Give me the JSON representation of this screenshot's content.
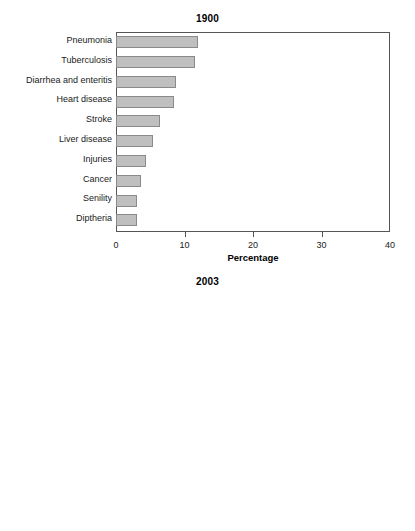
{
  "figure": {
    "panels": [
      "chart_1900",
      "chart_2003"
    ]
  },
  "chart_data": [
    {
      "type": "bar",
      "orientation": "horizontal",
      "title": "1900",
      "xlabel": "Percentage",
      "ylabel": "",
      "xlim": [
        0,
        40
      ],
      "xticks": [
        0,
        10,
        20,
        30,
        40
      ],
      "xtick_labels": [
        "0",
        "10",
        "20",
        "30",
        "40"
      ],
      "grid": false,
      "legend": false,
      "bar_color": "#bfbfbf",
      "bar_edge_color": "#8a8a8a",
      "categories": [
        "Pneumonia",
        "Tuberculosis",
        "Diarrhea and enteritis",
        "Heart disease",
        "Stroke",
        "Liver disease",
        "Injuries",
        "Cancer",
        "Senility",
        "Diptheria"
      ],
      "values": [
        12.0,
        11.5,
        8.7,
        8.5,
        6.4,
        5.4,
        4.4,
        3.7,
        3.1,
        3.1
      ]
    },
    {
      "type": "bar",
      "orientation": "horizontal",
      "title": "2003",
      "xlabel": "Percentage",
      "ylabel": "",
      "xlim": [
        0,
        40
      ],
      "xticks": [
        0,
        10,
        20,
        30,
        40
      ],
      "xtick_labels": [
        "0",
        "10",
        "20",
        "30",
        "40"
      ],
      "grid": false,
      "legend": false,
      "bar_color": "#bfbfbf",
      "bar_edge_color": "#8a8a8a",
      "categories": [
        "Heart disease",
        "Cancer",
        "Stroke",
        "Chronic lung disease",
        "Unintentional injury",
        "Diabetes",
        "Influenza and pneumonia",
        "Alzheimer's disease",
        "Kidney disease",
        "Septicemia"
      ],
      "values": [
        28.7,
        22.8,
        6.7,
        5.1,
        4.2,
        3.1,
        2.5,
        2.5,
        1.6,
        1.3
      ]
    }
  ]
}
